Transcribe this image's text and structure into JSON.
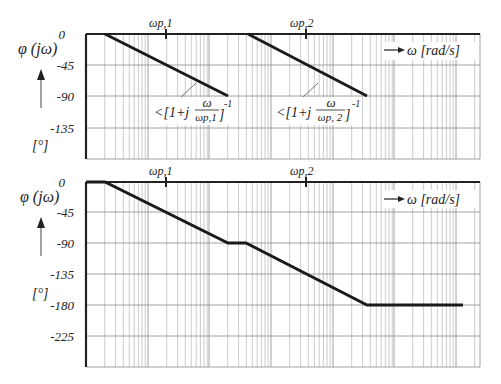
{
  "chart_data": [
    {
      "type": "line",
      "title": "",
      "xlabel": "ω [rad/s]",
      "ylabel": "φ (jω)",
      "yunit": "[°]",
      "xscale": "log",
      "grid": true,
      "yticks": [
        "0",
        "-45",
        "-90",
        "-135"
      ],
      "ylim": [
        -180,
        0
      ],
      "x_markers": [
        "ωp,1",
        "ωp,2"
      ],
      "series": [
        {
          "name": "<[1+j ω/ωp,1]^-1",
          "points": [
            [
              0.1,
              0
            ],
            [
              10,
              -90
            ]
          ],
          "note": "0.1·ωp,1 to 10·ωp,1"
        },
        {
          "name": "<[1+j ω/ωp,2]^-1",
          "points": [
            [
              0.1,
              0
            ],
            [
              10,
              -90
            ]
          ],
          "note": "0.1·ωp,2 to 10·ωp,2"
        }
      ],
      "annotations": [
        {
          "text_main": "<[1+j",
          "frac_num": "ω",
          "frac_den": "ωp,1",
          "exp": "-1"
        },
        {
          "text_main": "<[1+j",
          "frac_num": "ω",
          "frac_den": "ωp, 2",
          "exp": "-1"
        }
      ]
    },
    {
      "type": "line",
      "title": "",
      "xlabel": "ω [rad/s]",
      "ylabel": "φ (jω)",
      "yunit": "[°]",
      "xscale": "log",
      "grid": true,
      "yticks": [
        "0",
        "-45",
        "-90",
        "-135",
        "-180",
        "-225"
      ],
      "ylim": [
        -270,
        0
      ],
      "x_markers": [
        "ωp,1",
        "ωp,2"
      ],
      "series": [
        {
          "name": "total phase",
          "points": [
            [
              0,
              0
            ],
            [
              0.1,
              0
            ],
            [
              10,
              -90
            ],
            [
              13,
              -90
            ],
            [
              1000,
              -180
            ],
            [
              5000,
              -180
            ]
          ],
          "note": "x relative to ωp,1; ωp,2 ≈ 100·ωp,1 (approx)"
        }
      ]
    }
  ],
  "labels": {
    "top": {
      "ylabel": "φ (jω)",
      "unit": "[°]",
      "ticks": [
        "0",
        "-45",
        "-90",
        "-135"
      ],
      "marker1": "ωp,1",
      "marker2": "ωp,2",
      "xaxis": "ω [rad/s]",
      "ann1_pre": "<[1+j",
      "ann1_num": "ω",
      "ann1_den": "ωp,1",
      "ann1_post": "]",
      "ann1_exp": "-1",
      "ann2_pre": "<[1+j",
      "ann2_num": "ω",
      "ann2_den": "ωp, 2",
      "ann2_post": "]",
      "ann2_exp": "-1"
    },
    "bottom": {
      "ylabel": "φ (jω)",
      "unit": "[°]",
      "ticks": [
        "0",
        "-45",
        "-90",
        "-135",
        "-180",
        "-225"
      ],
      "marker1": "ωp,1",
      "marker2": "ωp,2",
      "xaxis": "ω [rad/s]"
    }
  },
  "colors": {
    "line": "#1a1a1a",
    "grid": "#9a9a9a",
    "axis": "#222222"
  }
}
